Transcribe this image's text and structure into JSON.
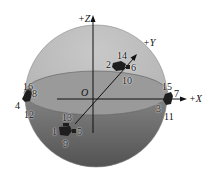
{
  "figure": {
    "axes": {
      "z": "+Z",
      "y": "+Y",
      "x": "+X",
      "origin": "O"
    },
    "colors": {
      "upper_hemisphere": "#b9b9b9",
      "equator_disk": "#a3a3a3",
      "lower_hemisphere": "#6e6e6e",
      "marker": "#1e1e1e"
    },
    "clusters": [
      {
        "name": "top-back",
        "labels": [
          "14",
          "2",
          "6",
          "10"
        ]
      },
      {
        "name": "left",
        "labels": [
          "16",
          "8",
          "4",
          "12"
        ]
      },
      {
        "name": "right",
        "labels": [
          "15",
          "7",
          "3",
          "11"
        ]
      },
      {
        "name": "front",
        "labels": [
          "13",
          "1",
          "5",
          "9"
        ]
      }
    ],
    "labels": {
      "n1": "1",
      "n2": "2",
      "n3": "3",
      "n4": "4",
      "n5": "5",
      "n6": "6",
      "n7": "7",
      "n8": "8",
      "n9": "9",
      "n10": "10",
      "n11": "11",
      "n12": "12",
      "n13": "13",
      "n14": "14",
      "n15": "15",
      "n16": "16"
    }
  }
}
